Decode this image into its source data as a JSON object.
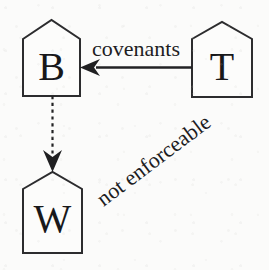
{
  "diagram": {
    "background_color": "#fbfbfa",
    "ink_color": "#202022",
    "nodes": [
      {
        "id": "B",
        "label": "B",
        "shape": "house",
        "x": 23,
        "y": 20,
        "width": 57,
        "height": 76,
        "roof_height": 19,
        "letter_x": 51,
        "letter_baseline": 80
      },
      {
        "id": "T",
        "label": "T",
        "shape": "house",
        "x": 192,
        "y": 22,
        "width": 60,
        "height": 75,
        "roof_height": 17,
        "letter_x": 222,
        "letter_baseline": 80
      },
      {
        "id": "W",
        "label": "W",
        "shape": "house",
        "x": 23,
        "y": 172,
        "width": 59,
        "height": 81,
        "roof_height": 17,
        "letter_x": 52,
        "letter_baseline": 232
      }
    ],
    "edges": [
      {
        "id": "covenants-edge",
        "from": "T",
        "to": "B",
        "style": "solid",
        "direction": "left",
        "label": "covenants",
        "label_x": 136,
        "label_baseline": 56,
        "x_start": 192,
        "x_end": 82,
        "y": 67
      },
      {
        "id": "not-enforceable-edge",
        "from": "B",
        "to": "W",
        "style": "dashed",
        "direction": "down",
        "label": "not enforceable",
        "label_rotation_deg": -37,
        "label_x": 158,
        "label_y": 166,
        "x": 52,
        "y_start": 96,
        "y_end": 172
      }
    ]
  }
}
